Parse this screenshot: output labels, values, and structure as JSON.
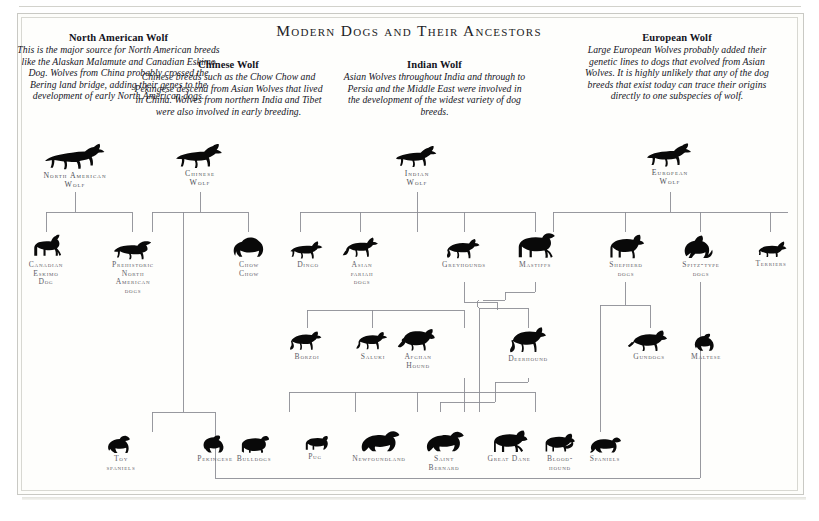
{
  "title": "Modern Dogs and Their Ancestors",
  "ancestor_notes": [
    {
      "name": "North American Wolf",
      "description": "This is the major source for North American breeds like the Alaskan Malamute and Canadian Eskimo Dog. Wolves from China probably crossed the Bering land bridge, adding their genes to the development of early North American dogs."
    },
    {
      "name": "Chinese Wolf",
      "description": "Chinese breeds such as the Chow Chow and Pekingese descend from Asian Wolves that lived in China. Wolves from northern India and Tibet were also involved in early breeding."
    },
    {
      "name": "Indian Wolf",
      "description": "Asian Wolves throughout India and through to Persia and the Middle East were involved in the development of the widest variety of dog breeds."
    },
    {
      "name": "European Wolf",
      "description": "Large European Wolves probably added their genetic lines to dogs that evolved from Asian Wolves. It is highly unlikely that any of the dog breeds that exist today can trace their origins directly to one subspecies of wolf."
    }
  ],
  "wolves": [
    {
      "label": "North American\nWolf",
      "icon": "wolf-silhouette"
    },
    {
      "label": "Chinese\nWolf",
      "icon": "wolf-silhouette"
    },
    {
      "label": "Indian\nWolf",
      "icon": "wolf-silhouette"
    },
    {
      "label": "European\nWolf",
      "icon": "wolf-silhouette"
    }
  ],
  "breed_row_1": [
    {
      "label": "Canadian\nEskimo\nDog",
      "icon": "dog-silhouette"
    },
    {
      "label": "Prehistoric\nNorth\nAmerican\ndogs",
      "icon": "dog-silhouette"
    },
    {
      "label": "Chow\nChow",
      "icon": "dog-silhouette"
    },
    {
      "label": "Dingo",
      "icon": "dog-silhouette"
    },
    {
      "label": "Asian\npariah\ndogs",
      "icon": "dog-silhouette"
    },
    {
      "label": "Greyhounds",
      "icon": "dog-silhouette"
    },
    {
      "label": "Mastiffs",
      "icon": "dog-silhouette"
    },
    {
      "label": "Shepherd\ndogs",
      "icon": "dog-silhouette"
    },
    {
      "label": "Spitz-type\ndogs",
      "icon": "dog-silhouette"
    },
    {
      "label": "Terriers",
      "icon": "dog-silhouette"
    }
  ],
  "breed_row_2": [
    {
      "label": "Borzoi",
      "icon": "dog-silhouette"
    },
    {
      "label": "Saluki",
      "icon": "dog-silhouette"
    },
    {
      "label": "Afghan\nHound",
      "icon": "dog-silhouette"
    },
    {
      "label": "Deerhound",
      "icon": "dog-silhouette"
    },
    {
      "label": "Gundogs",
      "icon": "dog-silhouette"
    },
    {
      "label": "Maltese",
      "icon": "dog-silhouette"
    }
  ],
  "breed_row_3": [
    {
      "label": "Toy\nspaniels",
      "icon": "dog-silhouette"
    },
    {
      "label": "Pekingese",
      "icon": "dog-silhouette"
    },
    {
      "label": "Bulldogs",
      "icon": "dog-silhouette"
    },
    {
      "label": "Pug",
      "icon": "dog-silhouette"
    },
    {
      "label": "Newfoundland",
      "icon": "dog-silhouette"
    },
    {
      "label": "Saint\nBernard",
      "icon": "dog-silhouette"
    },
    {
      "label": "Great Dane",
      "icon": "dog-silhouette"
    },
    {
      "label": "Blood-\nhound",
      "icon": "dog-silhouette"
    },
    {
      "label": "Spaniels",
      "icon": "dog-silhouette"
    }
  ],
  "colors": {
    "ink": "#090909",
    "label": "#5f6068",
    "rule": "#8d8e95",
    "frame": "#c9c9c4",
    "paper": "#fefefc"
  }
}
